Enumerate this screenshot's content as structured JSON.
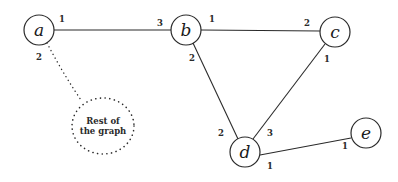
{
  "nodes": [
    {
      "id": "a",
      "label": "a",
      "cx": 39,
      "cy": 30,
      "r": 15
    },
    {
      "id": "b",
      "label": "b",
      "cx": 186,
      "cy": 30,
      "r": 15
    },
    {
      "id": "c",
      "label": "c",
      "cx": 335,
      "cy": 32,
      "r": 15
    },
    {
      "id": "d",
      "label": "d",
      "cx": 245,
      "cy": 152,
      "r": 15
    },
    {
      "id": "e",
      "label": "e",
      "cx": 366,
      "cy": 133,
      "r": 15
    }
  ],
  "edges": [
    {
      "from": "a",
      "to": "b",
      "from_port": "1",
      "to_port": "3"
    },
    {
      "from": "b",
      "to": "c",
      "from_port": "1",
      "to_port": "2"
    },
    {
      "from": "b",
      "to": "d",
      "from_port": "2",
      "to_port": "2"
    },
    {
      "from": "c",
      "to": "d",
      "from_port": "1",
      "to_port": "3"
    },
    {
      "from": "d",
      "to": "e",
      "from_port": "1",
      "to_port": "1"
    }
  ],
  "dotted_edge": {
    "from": "a",
    "to": "rest",
    "from_port": "2"
  },
  "rest_of_graph": {
    "line1": "Rest of",
    "line2": "the graph"
  },
  "port_labels": {
    "a_1": "1",
    "a_2": "2",
    "b_3": "3",
    "b_1": "1",
    "b_2": "2",
    "c_2": "2",
    "c_1": "1",
    "d_2": "2",
    "d_3": "3",
    "d_1": "1",
    "e_1": "1"
  },
  "node_labels": {
    "a": "a",
    "b": "b",
    "c": "c",
    "d": "d",
    "e": "e"
  }
}
